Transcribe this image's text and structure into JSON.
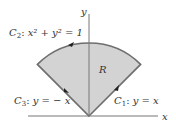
{
  "diagram": {
    "axes": {
      "x_label": "x",
      "y_label": "y"
    },
    "region": {
      "label": "R",
      "fill": "#d3d3d3",
      "stroke": "#6e6e6e"
    },
    "curves": [
      {
        "name": "C1",
        "sub": "1",
        "equation": "y = x"
      },
      {
        "name": "C2",
        "sub": "2",
        "equation": "x² + y² = 1"
      },
      {
        "name": "C3",
        "sub": "3",
        "equation": "y = − x"
      }
    ]
  }
}
